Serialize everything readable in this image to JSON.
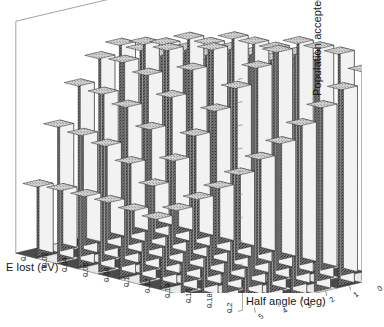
{
  "figure": {
    "background": "#ffffff",
    "style": "grayscale-3d-bar",
    "plot_type": "3d-bar"
  },
  "axes": {
    "x": {
      "title": "E lost (eV)",
      "ticks": [
        "0",
        "0.02",
        "0.04",
        "0.06",
        "0.08",
        "0.1",
        "0.12",
        "0.14",
        "0.16",
        "0.18",
        "0.2"
      ],
      "min": 0,
      "max": 0.2
    },
    "y": {
      "title": "Half angle (deg)",
      "ticks": [
        "5",
        "4",
        "3",
        "2",
        "1",
        "0"
      ],
      "min": 0,
      "max": 5,
      "direction": "decreasing-left-to-right"
    },
    "z": {
      "title": "Population accepted",
      "ticks": [
        "",
        "",
        "",
        "",
        "",
        "",
        "",
        "",
        "",
        ""
      ],
      "tick_count": 10,
      "labelled": false
    }
  },
  "colors": {
    "bar_front": "#f2f2f2",
    "bar_side": "#6e6e6e",
    "bar_top": "#c9c9c9",
    "bar_edge": "#2b2b2b",
    "floor_dark": "#4a4a4a",
    "floor_light": "#e8e8e8",
    "frame_line": "#8a8a8a",
    "text": "#161616"
  },
  "chart_data": {
    "type": "bar",
    "title": "",
    "xlabel": "E lost (eV)",
    "ylabel": "Half angle (deg)",
    "zlabel": "Population accepted",
    "x": [
      0,
      0.02,
      0.04,
      0.06,
      0.08,
      0.1,
      0.12,
      0.14,
      0.16,
      0.18,
      0.2
    ],
    "y": [
      5,
      4,
      3,
      2,
      1,
      0
    ],
    "xlim": [
      0,
      0.2
    ],
    "ylim": [
      0,
      5
    ],
    "zlim": [
      0,
      1
    ],
    "grid": true,
    "legend": false,
    "note": "Cumulative population accepted as a function of energy lost and collection half angle; values rise monotonically with E lost and with half angle, saturating (clipped at plot top) for large E lost.",
    "series": [
      {
        "name": "half angle 5 deg",
        "values": [
          0.3,
          0.58,
          0.78,
          0.92,
          1.0,
          1.0,
          1.0,
          1.0,
          1.0,
          1.0,
          1.0
        ]
      },
      {
        "name": "half angle 4 deg",
        "values": [
          0.26,
          0.52,
          0.72,
          0.88,
          0.98,
          1.0,
          1.0,
          1.0,
          1.0,
          1.0,
          1.0
        ]
      },
      {
        "name": "half angle 3 deg",
        "values": [
          0.21,
          0.45,
          0.64,
          0.8,
          0.93,
          1.0,
          1.0,
          1.0,
          1.0,
          1.0,
          1.0
        ]
      },
      {
        "name": "half angle 2 deg",
        "values": [
          0.16,
          0.35,
          0.52,
          0.68,
          0.82,
          0.93,
          1.0,
          1.0,
          1.0,
          1.0,
          1.0
        ]
      },
      {
        "name": "half angle 1 deg",
        "values": [
          0.1,
          0.23,
          0.36,
          0.49,
          0.62,
          0.74,
          0.85,
          0.94,
          1.0,
          1.0,
          1.0
        ]
      },
      {
        "name": "half angle 0 deg",
        "values": [
          0.04,
          0.1,
          0.17,
          0.24,
          0.32,
          0.41,
          0.5,
          0.6,
          0.7,
          0.8,
          0.9
        ]
      }
    ]
  }
}
